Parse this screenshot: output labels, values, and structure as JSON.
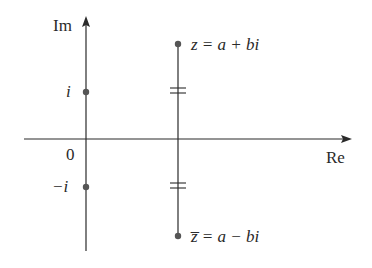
{
  "diagram": {
    "axes": {
      "imaginary_label": "Im",
      "real_label": "Re",
      "origin_label": "0"
    },
    "points": {
      "i_label": "i",
      "neg_i_label": "−i",
      "z_label": "z = a + bi",
      "zbar_label": "z̅ = a − bi"
    },
    "colors": {
      "line": "#2a2a2a",
      "point": "#555555"
    }
  }
}
